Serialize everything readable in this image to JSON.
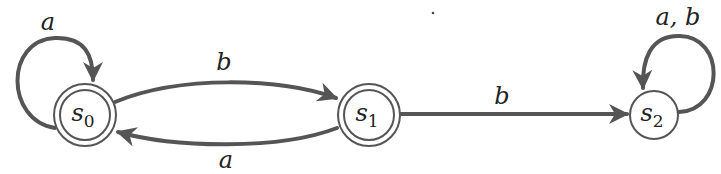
{
  "diagram": {
    "type": "finite-state-automaton",
    "colors": {
      "stroke": "#555555",
      "text": "#222222",
      "background": "#ffffff"
    },
    "states": [
      {
        "id": "s0",
        "name": "s",
        "subscript": "0",
        "final": true,
        "cx": 85,
        "cy": 115
      },
      {
        "id": "s1",
        "name": "s",
        "subscript": "1",
        "final": true,
        "cx": 369,
        "cy": 115
      },
      {
        "id": "s2",
        "name": "s",
        "subscript": "2",
        "final": false,
        "cx": 654,
        "cy": 115
      }
    ],
    "transitions": [
      {
        "from": "s0",
        "to": "s0",
        "label": "a"
      },
      {
        "from": "s0",
        "to": "s1",
        "label": "b"
      },
      {
        "from": "s1",
        "to": "s0",
        "label": "a"
      },
      {
        "from": "s1",
        "to": "s2",
        "label": "b"
      },
      {
        "from": "s2",
        "to": "s2",
        "label": "a, b"
      }
    ]
  }
}
